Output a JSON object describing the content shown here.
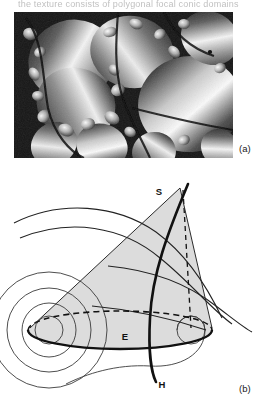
{
  "figure": {
    "top_cut_text": "the texture consists of polygonal focal conic domains",
    "panels": [
      {
        "id": "a",
        "label": "(a)",
        "kind": "micrograph",
        "description": "grayscale optical micrograph of a smectic focal conic (polygonal) texture showing large bright ellipsoidal domains on a dark background"
      },
      {
        "id": "b",
        "label": "(b)",
        "kind": "schematic",
        "description": "schematic of a focal conic domain: ellipse E in the horizontal plane, conjugate hyperbola H passing through the ellipse plane, cone apex S, and nested cyclide layers"
      }
    ]
  },
  "diagram": {
    "labels": {
      "apex": "S",
      "ellipse": "E",
      "hyperbola": "H"
    },
    "colors": {
      "line": "#111111",
      "thin_line": "#333333",
      "cone_fill": "#dcdcdc",
      "background": "#ffffff",
      "dashed": "#111111"
    },
    "geometry": {
      "ellipse_center_x": 120,
      "ellipse_center_y": 330,
      "ellipse_rx": 92,
      "ellipse_ry": 19,
      "apex_x": 180,
      "apex_y": 188,
      "focus_left_x": 49,
      "focus_left_y": 330,
      "focus_right_x": 191,
      "focus_right_y": 330,
      "cone_fill_opacity": 1,
      "nested_circle_radii": [
        14,
        27,
        42,
        58
      ],
      "hyperbola_top_y": 186,
      "hyperbola_bottom_y": 382
    }
  },
  "micrograph": {
    "tone": {
      "background": "#1b1b1b",
      "highlight": "#f2f2f2",
      "midtone": "#9a9a9a",
      "shadow": "#0d0d0d"
    },
    "domain_count_visible": 14
  }
}
